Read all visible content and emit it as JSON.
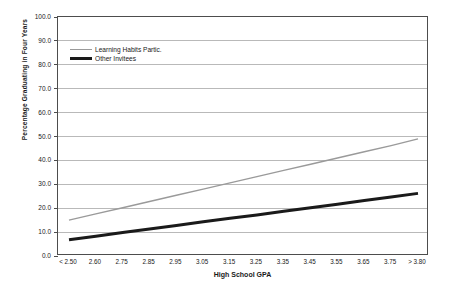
{
  "chart_data": {
    "type": "line",
    "title": "",
    "xlabel": "High School GPA",
    "ylabel": "Percentage Graduating in Four Years",
    "categories": [
      "< 2.50",
      "2.60",
      "2.75",
      "2.85",
      "2.95",
      "3.05",
      "3.15",
      "3.25",
      "3.35",
      "3.45",
      "3.55",
      "3.65",
      "3.75",
      "> 3.80"
    ],
    "series": [
      {
        "name": "Learning Habits Partic.",
        "color": "#9a9a9a",
        "width": 1.4,
        "values": [
          15.0,
          17.6,
          20.2,
          22.8,
          25.4,
          28.0,
          30.6,
          33.2,
          35.8,
          38.4,
          41.0,
          43.6,
          46.2,
          49.0
        ]
      },
      {
        "name": "Other Invitees",
        "color": "#1a1a1a",
        "width": 3.0,
        "values": [
          6.8,
          8.3,
          9.8,
          11.3,
          12.8,
          14.3,
          15.8,
          17.2,
          18.7,
          20.2,
          21.7,
          23.2,
          24.7,
          26.2
        ]
      }
    ],
    "ylim": [
      0,
      100
    ],
    "ytick_step": 10,
    "yticks": [
      "0.0",
      "10.0",
      "20.0",
      "30.0",
      "40.0",
      "50.0",
      "60.0",
      "70.0",
      "80.0",
      "90.0",
      "100.0"
    ],
    "grid": "horizontal",
    "legend_position": "upper-left-inside"
  },
  "axes": {
    "y_title": "Percentage Graduating in Four Years",
    "x_title": "High School GPA"
  }
}
